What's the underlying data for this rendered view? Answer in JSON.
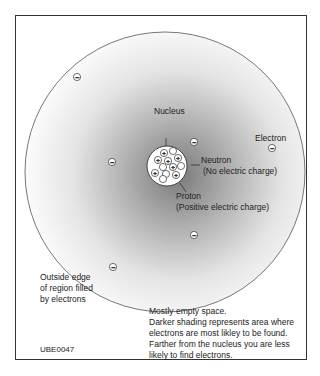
{
  "diagram": {
    "title_code": "UBE0047",
    "labels": {
      "nucleus": "Nucleus",
      "electron": "Electron",
      "neutron": "Neutron",
      "neutron_desc": "(No electric charge)",
      "proton": "Proton",
      "proton_desc": "(Positive electric charge)",
      "outside_edge_1": "Outside edge",
      "outside_edge_2": "of region filled",
      "outside_edge_3": "by electrons",
      "caption_1": "Mostly empty space.",
      "caption_2": "Darker shading represents area where",
      "caption_3": "electrons are most likley to be found.",
      "caption_4": "Farther from the nucleus you are less",
      "caption_5": "likely to find electrons."
    },
    "symbols": {
      "electron": "−",
      "proton": "+"
    },
    "colors": {
      "frame": "#333333",
      "circle": "#555555",
      "shade": "#9a9a9a"
    }
  }
}
